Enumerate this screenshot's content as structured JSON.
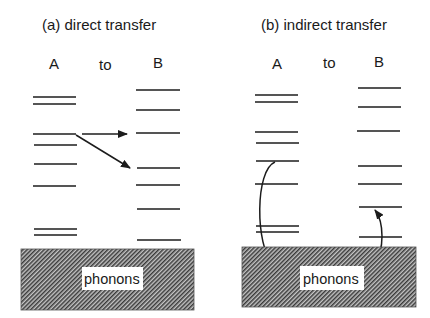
{
  "panels": [
    {
      "id": "a",
      "title": "(a)  direct transfer",
      "col_labels": {
        "a": "A",
        "to": "to",
        "b": "B"
      },
      "a_levels": [
        97,
        104,
        134,
        145,
        164,
        186,
        229,
        235
      ],
      "b_levels": [
        90,
        110,
        133,
        168,
        185,
        209,
        240
      ],
      "phonon_label": "phonons",
      "arrows": [
        "A level 3 to B level 3 (horizontal)",
        "A level 3 to B level 4 (diagonal)"
      ]
    },
    {
      "id": "b",
      "title": "(b)  indirect transfer",
      "col_labels": {
        "a": "A",
        "to": "to",
        "b": "B"
      },
      "a_levels": [
        95,
        102,
        132,
        143,
        161,
        184,
        226,
        232
      ],
      "b_levels": [
        88,
        107,
        131,
        166,
        184,
        207,
        237
      ],
      "phonon_label": "phonons",
      "arrows": [
        "A level 5 down into phonons",
        "phonons up to B level 6"
      ]
    }
  ],
  "colors": {
    "line": "#1c1c1c",
    "hatch_dark": "#3a3a3a",
    "hatch_light": "#bdbdbd",
    "background": "#ffffff"
  }
}
